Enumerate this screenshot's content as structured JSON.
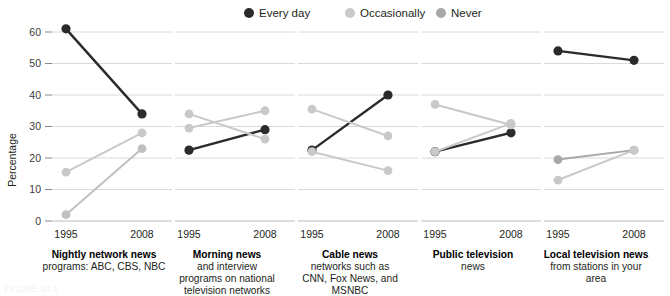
{
  "legend": {
    "items": [
      {
        "label": "Every day",
        "color": "#2b2b2b",
        "key": "every_day"
      },
      {
        "label": "Occasionally",
        "color": "#c9c9c9",
        "key": "occasionally"
      },
      {
        "label": "Never",
        "color": "#a8a8a8",
        "key": "never"
      }
    ]
  },
  "axis": {
    "y_label": "Percentage",
    "y_ticks": [
      "0",
      "10",
      "20",
      "30",
      "40",
      "50",
      "60"
    ],
    "y_tick_values": [
      0,
      10,
      20,
      30,
      40,
      50,
      60
    ],
    "x_ticks": [
      "1995",
      "2008"
    ]
  },
  "chart_data": {
    "type": "line",
    "title": "",
    "subtitle": "",
    "xlabel": "",
    "ylabel": "Percentage",
    "ylim": [
      0,
      62
    ],
    "grid": true,
    "legend_position": "top-center",
    "x": [
      "1995",
      "2008"
    ],
    "panels": [
      {
        "title": "Nightly network news",
        "subtitle": "programs: ABC, CBS, NBC",
        "series": [
          {
            "name": "Every day",
            "color": "#2b2b2b",
            "values": [
              61,
              34
            ]
          },
          {
            "name": "Occasionally",
            "color": "#c9c9c9",
            "values": [
              15.5,
              28
            ]
          },
          {
            "name": "Never",
            "color": "#c0c0c0",
            "values": [
              2,
              23
            ]
          }
        ]
      },
      {
        "title": "Morning news",
        "subtitle": "and interview\nprograms on national\ntelevision networks",
        "series": [
          {
            "name": "Every day",
            "color": "#2b2b2b",
            "values": [
              22.5,
              29
            ]
          },
          {
            "name": "Occasionally",
            "color": "#c9c9c9",
            "values": [
              34,
              26
            ]
          },
          {
            "name": "Never",
            "color": "#c9c9c9",
            "values": [
              29.5,
              35
            ]
          }
        ]
      },
      {
        "title": "Cable news",
        "subtitle": "networks such as\nCNN, Fox News, and\nMSNBC",
        "series": [
          {
            "name": "Every day",
            "color": "#2b2b2b",
            "values": [
              22.5,
              40
            ]
          },
          {
            "name": "Occasionally",
            "color": "#c9c9c9",
            "values": [
              35.5,
              27
            ]
          },
          {
            "name": "Never",
            "color": "#c9c9c9",
            "values": [
              22,
              16
            ]
          }
        ]
      },
      {
        "title": "Public television",
        "subtitle": "news",
        "series": [
          {
            "name": "Every day",
            "color": "#2b2b2b",
            "values": [
              22,
              28
            ]
          },
          {
            "name": "Occasionally",
            "color": "#c9c9c9",
            "values": [
              37,
              30.5
            ]
          },
          {
            "name": "Never",
            "color": "#c9c9c9",
            "values": [
              22,
              31
            ]
          }
        ]
      },
      {
        "title": "Local television news",
        "subtitle": "from stations in your\narea",
        "series": [
          {
            "name": "Every day",
            "color": "#2b2b2b",
            "values": [
              54,
              51
            ]
          },
          {
            "name": "Never",
            "color": "#a8a8a8",
            "values": [
              19.5,
              22.5
            ]
          },
          {
            "name": "Occasionally",
            "color": "#c9c9c9",
            "values": [
              13,
              22.5
            ]
          }
        ]
      }
    ]
  },
  "footnote": "FIGURE 10.1"
}
